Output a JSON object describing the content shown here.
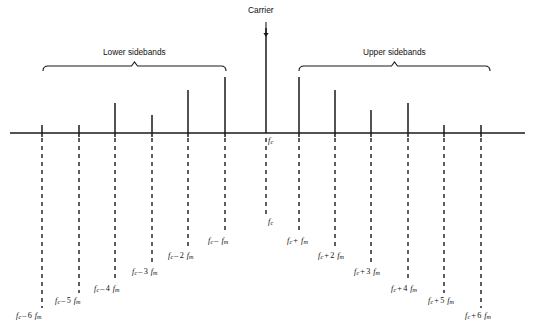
{
  "figure": {
    "type": "spectrum-line-diagram",
    "carrier_label": "Carrier",
    "lower_band_label": "Lower sidebands",
    "upper_band_label": "Upper sidebands",
    "carrier_tick_label_top": "f",
    "carrier_tick_sub_top": "c",
    "carrier_tick_label_bottom": "f",
    "carrier_tick_sub_bottom": "c",
    "axis_color": "#1a1a1a",
    "line_color": "#1a1a1a",
    "dash_color": "#1a1a1a",
    "background": "#ffffff"
  },
  "chart_data": {
    "type": "bar",
    "title": "Carrier",
    "xlabel": "",
    "ylabel": "",
    "grid": false,
    "legend": false,
    "annotations": [
      "Carrier",
      "Lower sidebands",
      "Upper sidebands"
    ],
    "categories": [
      "f_c - 6 f_m",
      "f_c - 5 f_m",
      "f_c - 4 f_m",
      "f_c - 3 f_m",
      "f_c - 2 f_m",
      "f_c - f_m",
      "f_c",
      "f_c + f_m",
      "f_c + 2 f_m",
      "f_c + 3 f_m",
      "f_c + 4 f_m",
      "f_c + 5 f_m",
      "f_c + 6 f_m"
    ],
    "values": [
      8,
      8,
      30,
      18,
      43,
      56,
      105,
      56,
      43,
      23,
      30,
      8,
      8
    ],
    "ylim": [
      0,
      110
    ]
  },
  "lines": [
    {
      "name": "lsb-6",
      "x": 42,
      "top": 125,
      "base": 133,
      "label_text": "f",
      "label_sub": "c",
      "label_op": "–",
      "label_num": "6",
      "label_var": "f",
      "label_var_sub": "m",
      "label_x": 16,
      "label_y": 312,
      "drop_to": 308
    },
    {
      "name": "lsb-5",
      "x": 79,
      "top": 125,
      "base": 133,
      "label_text": "f",
      "label_sub": "c",
      "label_op": "–",
      "label_num": "5",
      "label_var": "f",
      "label_var_sub": "m",
      "label_x": 55,
      "label_y": 297,
      "drop_to": 293
    },
    {
      "name": "lsb-4",
      "x": 115,
      "top": 103,
      "base": 133,
      "label_text": "f",
      "label_sub": "c",
      "label_op": "–",
      "label_num": "4",
      "label_var": "f",
      "label_var_sub": "m",
      "label_x": 94,
      "label_y": 285,
      "drop_to": 281
    },
    {
      "name": "lsb-3",
      "x": 152,
      "top": 115,
      "base": 133,
      "label_text": "f",
      "label_sub": "c",
      "label_op": "–",
      "label_num": "3",
      "label_var": "f",
      "label_var_sub": "m",
      "label_x": 132,
      "label_y": 268,
      "drop_to": 264
    },
    {
      "name": "lsb-2",
      "x": 188,
      "top": 90,
      "base": 133,
      "label_text": "f",
      "label_sub": "c",
      "label_op": "–",
      "label_num": "2",
      "label_var": "f",
      "label_var_sub": "m",
      "label_x": 168,
      "label_y": 252,
      "drop_to": 248
    },
    {
      "name": "lsb-1",
      "x": 225,
      "top": 77,
      "base": 133,
      "label_text": "f",
      "label_sub": "c",
      "label_op": "–",
      "label_num": "",
      "label_var": "f",
      "label_var_sub": "m",
      "label_x": 208,
      "label_y": 237,
      "drop_to": 233
    },
    {
      "name": "carrier",
      "x": 266,
      "top": 28,
      "base": 133,
      "label_text": "f",
      "label_sub": "c",
      "label_op": "",
      "label_num": "",
      "label_var": "",
      "label_var_sub": "",
      "label_x": 268,
      "label_y": 218,
      "drop_to": 214
    },
    {
      "name": "usb-1",
      "x": 299,
      "top": 77,
      "base": 133,
      "label_text": "f",
      "label_sub": "c",
      "label_op": "+",
      "label_num": "",
      "label_var": "f",
      "label_var_sub": "m",
      "label_x": 287,
      "label_y": 237,
      "drop_to": 233
    },
    {
      "name": "usb-2",
      "x": 335,
      "top": 90,
      "base": 133,
      "label_text": "f",
      "label_sub": "c",
      "label_op": "+",
      "label_num": "2",
      "label_var": "f",
      "label_var_sub": "m",
      "label_x": 318,
      "label_y": 252,
      "drop_to": 248
    },
    {
      "name": "usb-3",
      "x": 371,
      "top": 110,
      "base": 133,
      "label_text": "f",
      "label_sub": "c",
      "label_op": "+",
      "label_num": "3",
      "label_var": "f",
      "label_var_sub": "m",
      "label_x": 354,
      "label_y": 268,
      "drop_to": 264
    },
    {
      "name": "usb-4",
      "x": 408,
      "top": 103,
      "base": 133,
      "label_text": "f",
      "label_sub": "c",
      "label_op": "+",
      "label_num": "4",
      "label_var": "f",
      "label_var_sub": "m",
      "label_x": 391,
      "label_y": 285,
      "drop_to": 281
    },
    {
      "name": "usb-5",
      "x": 444,
      "top": 125,
      "base": 133,
      "label_text": "f",
      "label_sub": "c",
      "label_op": "+",
      "label_num": "5",
      "label_var": "f",
      "label_var_sub": "m",
      "label_x": 428,
      "label_y": 297,
      "drop_to": 293
    },
    {
      "name": "usb-6",
      "x": 481,
      "top": 125,
      "base": 133,
      "label_text": "f",
      "label_sub": "c",
      "label_op": "+",
      "label_num": "6",
      "label_var": "f",
      "label_var_sub": "m",
      "label_x": 465,
      "label_y": 312,
      "drop_to": 308
    }
  ],
  "axis": {
    "x1": 10,
    "x2": 525,
    "y": 133
  },
  "brackets": {
    "lower": {
      "x1": 43,
      "x2": 226,
      "y": 66,
      "title_x": 103,
      "title_y": 48
    },
    "upper": {
      "x1": 299,
      "x2": 490,
      "y": 66,
      "title_x": 363,
      "title_y": 48
    }
  },
  "carrier_marker": {
    "arrow_x": 266,
    "arrow_y1": 22,
    "arrow_y2": 37,
    "title_x": 248,
    "title_y": 6
  }
}
